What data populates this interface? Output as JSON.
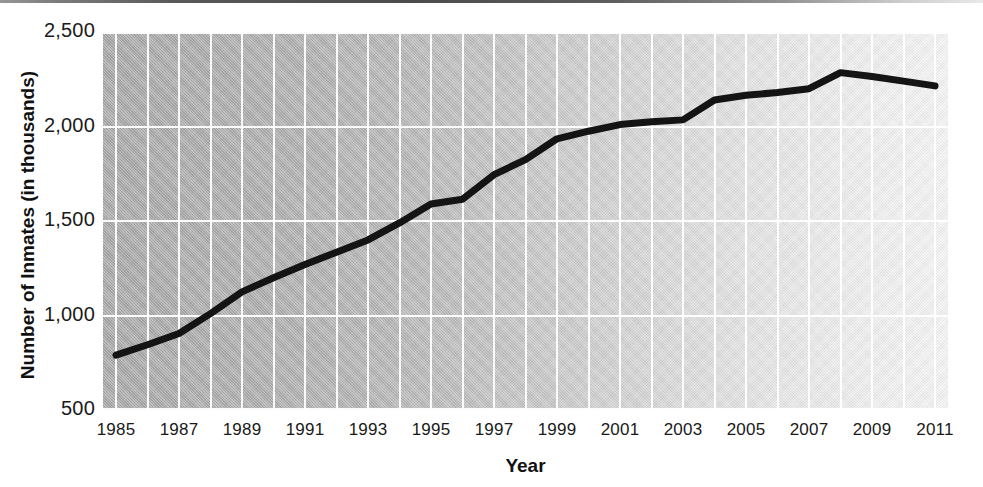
{
  "chart_data": {
    "type": "line",
    "title": "",
    "xlabel": "Year",
    "ylabel": "Number of Inmates (in thousands)",
    "xlim": [
      1985,
      2011
    ],
    "ylim": [
      500,
      2500
    ],
    "grid": true,
    "legend": null,
    "x_tick_labels": [
      "1985",
      "1987",
      "1989",
      "1991",
      "1993",
      "1995",
      "1997",
      "1999",
      "2001",
      "2003",
      "2005",
      "2007",
      "2009",
      "2011"
    ],
    "y_tick_labels": [
      "500",
      "1,000",
      "1,500",
      "2,000",
      "2,500"
    ],
    "y_tick_values": [
      500,
      1000,
      1500,
      2000,
      2500
    ],
    "series": [
      {
        "name": "Number of Inmates",
        "color": "#141414",
        "x": [
          1985,
          1986,
          1987,
          1988,
          1989,
          1990,
          1991,
          1992,
          1993,
          1994,
          1995,
          1996,
          1997,
          1998,
          1999,
          2000,
          2001,
          2002,
          2003,
          2004,
          2005,
          2006,
          2007,
          2008,
          2009,
          2010,
          2011
        ],
        "values": [
          790,
          845,
          905,
          1010,
          1125,
          1200,
          1270,
          1335,
          1400,
          1490,
          1590,
          1615,
          1745,
          1825,
          1935,
          1975,
          2010,
          2025,
          2035,
          2140,
          2165,
          2180,
          2200,
          2285,
          2265,
          2240,
          2215
        ]
      }
    ]
  }
}
